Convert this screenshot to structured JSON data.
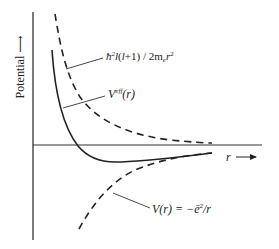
{
  "diagram": {
    "type": "effective-potential-plot",
    "y_axis": {
      "label": "Potential",
      "arrow": "up-arrow"
    },
    "x_axis": {
      "label": "r",
      "arrow": "right-arrow"
    },
    "curves": [
      {
        "id": "centrifugal",
        "style": "dashed",
        "label": "ħ²l(l+1) / 2mₑr²",
        "label_parts": {
          "hbar": "ħ",
          "sq": "2",
          "l1": "l",
          "mid": "(",
          "l2": "l",
          "tail": "+1) / 2m",
          "sub": "e",
          "r": "r",
          "sq2": "2"
        }
      },
      {
        "id": "effective",
        "style": "solid",
        "label": "Veff(r)",
        "label_parts": {
          "v": "V",
          "sup": "eff",
          "arg": "(r)"
        }
      },
      {
        "id": "coulomb",
        "style": "dashed",
        "label": "V(r) = −ē²/r",
        "label_parts": {
          "lhs": "V(r) = −",
          "e": "ē",
          "sq": "2",
          "rhs": "/r"
        }
      }
    ],
    "colors": {
      "line": "#222222",
      "axis": "#333333",
      "background": "#ffffff"
    }
  }
}
